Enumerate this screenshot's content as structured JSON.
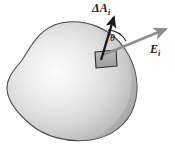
{
  "figure": {
    "background_color": "#ffffff",
    "labels": {
      "area_vector": "ΔA",
      "area_vector_subscript": "i",
      "field_vector": "E",
      "field_vector_subscript": "i",
      "angle": "θ"
    },
    "colors": {
      "surface_light": "#f2f2f2",
      "surface_mid": "#c9c9c9",
      "surface_dark": "#9a9a9a",
      "surface_outline": "#4a4a4a",
      "area_arrow": "#1a1a1a",
      "field_arrow": "#8e8e8e",
      "patch_fill": "#a8a8a8",
      "patch_outline": "#2b2b2b",
      "angle_arc": "#1a1a1a",
      "text": "#1a1a1a"
    },
    "elements": [
      {
        "name": "closed-surface-blob",
        "description": "shaded irregular closed surface"
      },
      {
        "name": "surface-patch",
        "description": "small parallelogram area element on the surface"
      },
      {
        "name": "area-vector-arrow",
        "description": "bold black arrow normal to the patch"
      },
      {
        "name": "field-vector-arrow",
        "description": "gray arrow representing the electric field"
      },
      {
        "name": "angle-arc",
        "description": "arc between area vector and field vector"
      }
    ]
  }
}
